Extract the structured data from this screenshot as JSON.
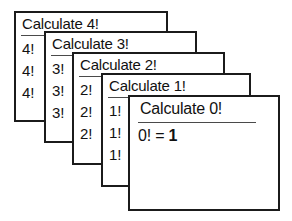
{
  "diagram": {
    "name": "recursive-factorial-call-stack",
    "background_color": "#ffffff",
    "border_color": "#1b1b1b",
    "text_color": "#111111",
    "rule_color": "#4a4a4a",
    "cards": [
      {
        "id": "card-4",
        "title": "Calculate 4!",
        "lines": [
          "4!",
          "4!",
          "4!"
        ],
        "bold_lines": [
          false,
          false,
          false
        ]
      },
      {
        "id": "card-3",
        "title": "Calculate 3!",
        "lines": [
          "3!",
          "3!",
          "3!"
        ],
        "bold_lines": [
          false,
          false,
          false
        ]
      },
      {
        "id": "card-2",
        "title": "Calculate 2!",
        "lines": [
          "2!",
          "2!",
          "2!"
        ],
        "bold_lines": [
          false,
          false,
          false
        ]
      },
      {
        "id": "card-1",
        "title": "Calculate 1!",
        "lines": [
          "1!",
          "1!",
          "1!"
        ],
        "bold_lines": [
          false,
          false,
          false
        ]
      },
      {
        "id": "card-0",
        "title": "Calculate 0!",
        "lines": [
          "0! = 1"
        ],
        "bold_lines": [
          false
        ],
        "result_prefix": "0! = ",
        "result_value": "1"
      }
    ]
  }
}
